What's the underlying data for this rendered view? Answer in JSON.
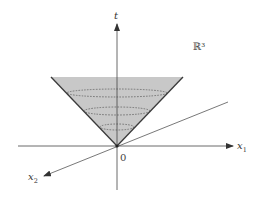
{
  "figure": {
    "space_label": "ℝ³",
    "axes": {
      "t": {
        "label": "t"
      },
      "x1": {
        "label": "x",
        "subscript": "1"
      },
      "x2": {
        "label": "x",
        "subscript": "2"
      }
    },
    "origin_label": "0",
    "colors": {
      "cone_fill": "#c8c8c8",
      "cone_edge": "#3a3a3a",
      "axis": "#444444",
      "dashed": "#555555"
    }
  }
}
